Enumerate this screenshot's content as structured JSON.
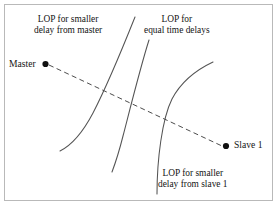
{
  "figure": {
    "background_color": "#ffffff",
    "border_color": "#b9b9b9",
    "ink_color": "#4a4a4a",
    "text_color": "#151515"
  },
  "annotations": {
    "lop_smaller_delay_master": {
      "line1": "LOP for smaller",
      "line2": "delay from master"
    },
    "lop_equal_time_delays": {
      "line1": "LOP for",
      "line2": "equal time delays"
    },
    "lop_smaller_delay_slave": {
      "line1": "LOP for smaller",
      "line2": "delay from slave 1"
    }
  },
  "nodes": {
    "master": {
      "label": "Master"
    },
    "slave1": {
      "label": "Slave 1"
    }
  },
  "icons": {
    "master_point": "filled-circle-icon",
    "slave_point": "filled-circle-icon",
    "baseline": "dashed-line-icon"
  }
}
